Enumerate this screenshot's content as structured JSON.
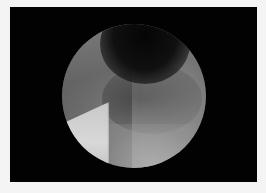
{
  "image": {
    "description": "Circular endoscopic/fluoroscopic grayscale view on black background",
    "colors": {
      "background": "#f4f4f4",
      "frame": "#020202",
      "scope_mid": "#7a7a7a",
      "scope_bright": "#d8d8d8",
      "scope_dark": "#050505"
    }
  }
}
